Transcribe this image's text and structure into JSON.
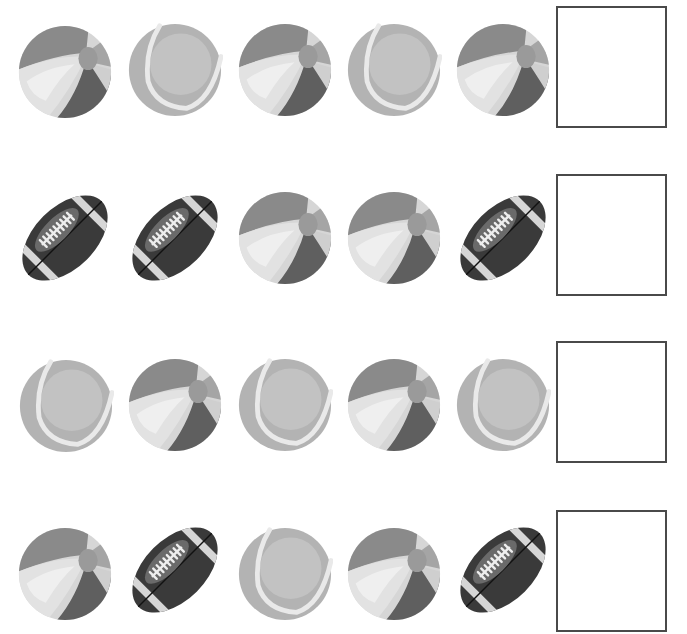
{
  "worksheet": {
    "task": "pattern-completion",
    "rows": [
      {
        "items": [
          "beach-ball",
          "tennis-ball",
          "beach-ball",
          "tennis-ball",
          "beach-ball"
        ],
        "answer": ""
      },
      {
        "items": [
          "football",
          "football",
          "beach-ball",
          "beach-ball",
          "football"
        ],
        "answer": ""
      },
      {
        "items": [
          "tennis-ball",
          "beach-ball",
          "tennis-ball",
          "beach-ball",
          "tennis-ball"
        ],
        "answer": ""
      },
      {
        "items": [
          "beach-ball",
          "football",
          "tennis-ball",
          "beach-ball",
          "football"
        ],
        "answer": ""
      }
    ]
  },
  "colors": {
    "box_border": "#4a4a4a",
    "beach_dark": "#5e5e5e",
    "beach_mid": "#8f8f8f",
    "beach_light": "#d8d8d8",
    "tennis_body": "#b9b9b9",
    "tennis_seam": "#e6e6e6",
    "football_body": "#3a3a3a",
    "football_stripe": "#d6d6d6"
  }
}
